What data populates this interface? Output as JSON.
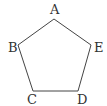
{
  "diagram": {
    "type": "pentagon",
    "vertices": [
      {
        "label": "A",
        "x": 54,
        "y": 19,
        "lx": 50,
        "ly": 14
      },
      {
        "label": "E",
        "x": 91,
        "y": 45,
        "lx": 94,
        "ly": 52
      },
      {
        "label": "D",
        "x": 78,
        "y": 91,
        "lx": 77,
        "ly": 104
      },
      {
        "label": "C",
        "x": 33,
        "y": 91,
        "lx": 27,
        "ly": 104
      },
      {
        "label": "B",
        "x": 18,
        "y": 45,
        "lx": 8,
        "ly": 52
      }
    ],
    "colors": {
      "stroke": "#444444",
      "text": "#333333",
      "background": "#ffffff"
    }
  }
}
